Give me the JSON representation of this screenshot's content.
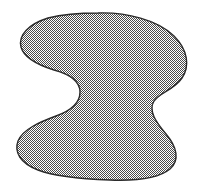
{
  "figure": {
    "name": "shaded-blob-region",
    "canvas": {
      "width": 201,
      "height": 192,
      "background_color": "#ffffff"
    },
    "outline": {
      "color": "#2b2b2b",
      "width": 1.4,
      "style": "solid"
    },
    "fill": {
      "pattern": "checkerboard-dither-50",
      "dark_color": "#4a4a4a",
      "light_color": "#ffffff",
      "cell_size": 2,
      "apparent_gray": "#b4b4b4"
    },
    "geometry": {
      "bounds": {
        "left": 16,
        "top": 13,
        "right": 188,
        "bottom": 180
      },
      "notches": [
        {
          "side": "left",
          "tip_x": 80,
          "tip_y": 90,
          "depth": 64
        },
        {
          "side": "right",
          "tip_x": 152,
          "tip_y": 101,
          "depth": 36
        }
      ],
      "path": "M 98 13 C 126 12 158 20 174 36 C 188 50 190 66 182 78 C 174 90 160 92 154 101 C 148 111 156 122 166 134 C 177 147 180 160 170 169 C 158 179 136 181 110 180 C 82 179 56 177 38 170 C 20 163 14 152 18 141 C 23 129 40 122 56 116 C 70 111 80 103 80 92 C 80 81 69 74 54 70 C 38 65 24 58 21 47 C 18 35 29 24 48 18 C 64 14 82 13 98 13 Z"
    }
  }
}
